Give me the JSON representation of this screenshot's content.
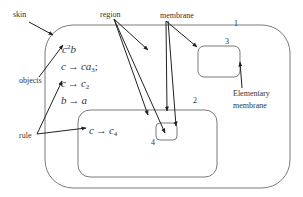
{
  "diagram": {
    "type": "membrane-structure",
    "labels": {
      "skin": "skin",
      "region": "region",
      "membrane": "membrane",
      "objects": "objects",
      "rule": "rule",
      "elementary_line1": "Elementary",
      "elementary_line2": "membrane"
    },
    "membranes": [
      {
        "id": "1",
        "label": "1",
        "role": "skin"
      },
      {
        "id": "2",
        "label": "2"
      },
      {
        "id": "3",
        "label": "3",
        "role": "elementary"
      },
      {
        "id": "4",
        "label": "4"
      }
    ],
    "contents": {
      "objects_c": "c",
      "objects_sup": "2",
      "objects_b": "b",
      "rule1_lhs": "c",
      "rule1_rhs_c": "ca",
      "rule1_rhs_sub": "3",
      "rule1_sep": ";",
      "rule2_lhs": "c",
      "rule2_rhs": "c",
      "rule2_sub": "2",
      "rule3_lhs": "b",
      "rule3_rhs": "a",
      "rule4_lhs": "c",
      "rule4_rhs": "c",
      "rule4_sub": "4",
      "arrow": "→"
    },
    "colors": {
      "membrane_stroke": "#7a7a7a",
      "arrow": "#222222",
      "text": "#333333",
      "background": "#ffffff"
    }
  }
}
